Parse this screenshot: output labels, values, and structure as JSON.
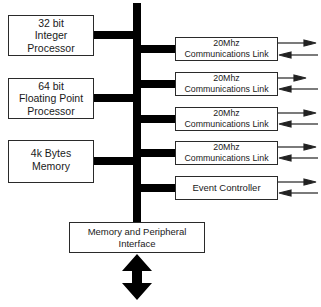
{
  "diagram": {
    "type": "block-diagram",
    "title": "",
    "bus": {
      "orientation": "vertical",
      "color": "#000000"
    },
    "left_blocks": [
      {
        "id": "integer-processor",
        "lines": [
          "32 bit",
          "Integer",
          "Processor"
        ]
      },
      {
        "id": "floating-point-processor",
        "lines": [
          "64 bit",
          "Floating Point",
          "Processor"
        ]
      },
      {
        "id": "memory",
        "lines": [
          "4k Bytes",
          "Memory"
        ]
      }
    ],
    "right_blocks": [
      {
        "id": "comm-link-1",
        "lines": [
          "20Mhz",
          "Communications Link"
        ],
        "io": "bidirectional"
      },
      {
        "id": "comm-link-2",
        "lines": [
          "20Mhz",
          "Communications Link"
        ],
        "io": "bidirectional"
      },
      {
        "id": "comm-link-3",
        "lines": [
          "20Mhz",
          "Communications Link"
        ],
        "io": "bidirectional"
      },
      {
        "id": "comm-link-4",
        "lines": [
          "20Mhz",
          "Communications Link"
        ],
        "io": "bidirectional"
      },
      {
        "id": "event-controller",
        "lines": [
          "Event Controller"
        ],
        "io": "bidirectional"
      }
    ],
    "bottom_block": {
      "id": "memory-peripheral-interface",
      "lines": [
        "Memory and Peripheral",
        "Interface"
      ],
      "io": "bidirectional-vertical"
    },
    "colors": {
      "line": "#000000",
      "box_border": "#2a2a2a",
      "background": "#ffffff"
    }
  }
}
